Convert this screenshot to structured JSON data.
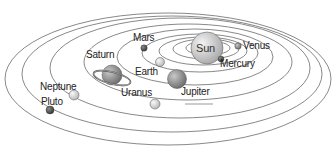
{
  "diagram": {
    "colors": {
      "background": "#ffffff",
      "orbit": "#555555",
      "sun": "#d6d6d6",
      "planet_light": "#e6e6e6",
      "planet_mid": "#9a9a9a",
      "planet_dark": "#555555"
    },
    "labels": {
      "sun": "Sun",
      "mercury": "Mercury",
      "venus": "Venus",
      "earth": "Earth",
      "mars": "Mars",
      "jupiter": "Jupiter",
      "saturn": "Saturn",
      "uranus": "Uranus",
      "neptune": "Neptune",
      "pluto": "Pluto"
    }
  }
}
